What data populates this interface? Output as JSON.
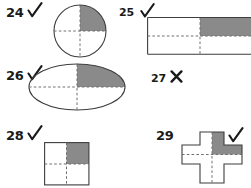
{
  "page": {
    "width": 251,
    "height": 188,
    "background": "#ffffff"
  },
  "style": {
    "shade_color": "#8a8a8a",
    "outline_color": "#3d3d3d",
    "dash_color": "#6e6e6e",
    "text_color": "#1a1a1a",
    "fill_color": "#ffffff"
  },
  "problems": [
    {
      "number": "24",
      "mark": "✓",
      "mark_name": "check-mark",
      "shape": "circle",
      "shaded_quadrant": "upper-right",
      "shaded_fraction": "1/4"
    },
    {
      "number": "25",
      "mark": "✓",
      "mark_name": "check-mark",
      "shape": "rectangle",
      "shaded_quadrant": "upper-right",
      "shaded_fraction": "1/4"
    },
    {
      "number": "26",
      "mark": "✓",
      "mark_name": "check-mark",
      "shape": "ellipse",
      "shaded_quadrant": "upper-right",
      "shaded_fraction": "1/4"
    },
    {
      "number": "27",
      "mark": "✗",
      "mark_name": "cross-mark",
      "shape": "none",
      "shaded_quadrant": "",
      "shaded_fraction": ""
    },
    {
      "number": "28",
      "mark": "✓",
      "mark_name": "check-mark",
      "shape": "square",
      "shaded_quadrant": "upper-right",
      "shaded_fraction": "1/4"
    },
    {
      "number": "29",
      "mark": "✓",
      "mark_name": "check-mark",
      "shape": "cross",
      "shaded_quadrant": "upper-right",
      "shaded_fraction": "1/4"
    }
  ]
}
